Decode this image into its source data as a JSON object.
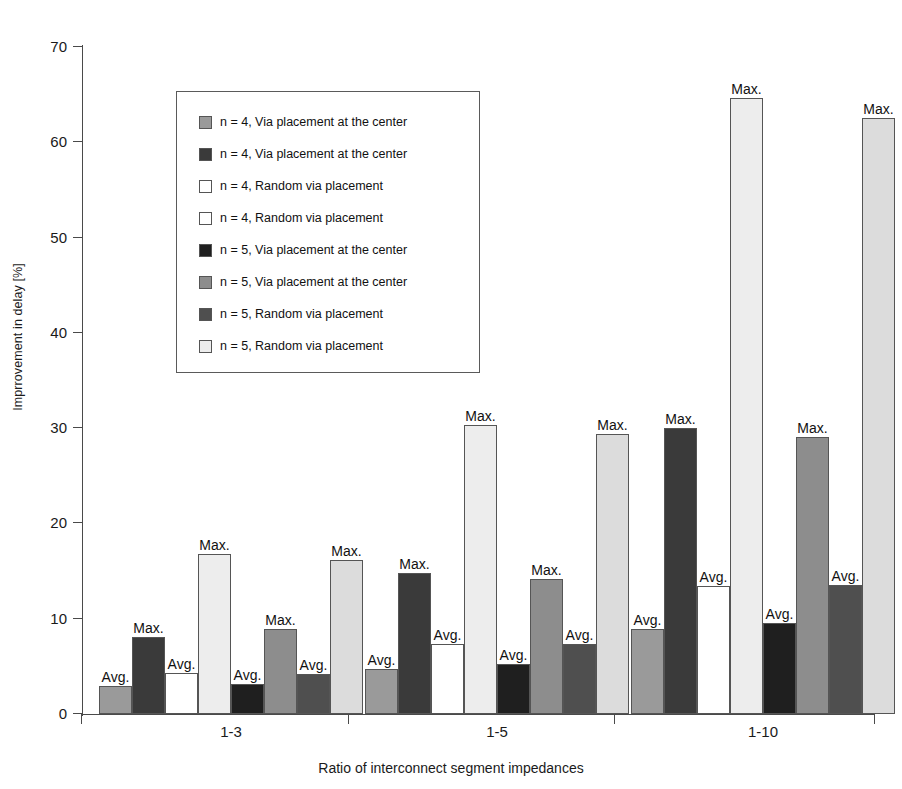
{
  "chart_data": {
    "type": "bar",
    "title": "",
    "subtitle": "",
    "xlabel": "Ratio of interconnect segment impedances",
    "ylabel": "Imprrovement in delay [%]",
    "ylim": [
      0,
      70
    ],
    "yticks": [
      0,
      10,
      20,
      30,
      40,
      50,
      60,
      70
    ],
    "ytick_labels": [
      "0",
      "10",
      "20",
      "30",
      "40",
      "50",
      "60",
      "70"
    ],
    "grid": false,
    "legend_position": "upper-left-inset",
    "categories": [
      "1-3",
      "1-5",
      "1-10"
    ],
    "series": [
      {
        "name": "n = 4, Via placement at the center",
        "stat": "Avg.",
        "color": "#9a9a9a",
        "values": [
          2.9,
          4.7,
          8.9
        ]
      },
      {
        "name": "n = 4, Via placement at the center",
        "stat": "Max.",
        "color": "#3a3a3a",
        "values": [
          8.1,
          14.8,
          30.0
        ]
      },
      {
        "name": "n = 4, Random via placement",
        "stat": "Avg.",
        "color": "#ffffff",
        "values": [
          4.3,
          7.3,
          13.4
        ]
      },
      {
        "name": "n = 4, Random via placement",
        "stat": "Max.",
        "color": "#ededed",
        "values": [
          16.8,
          30.3,
          64.6
        ]
      },
      {
        "name": "n = 5, Via placement at the center",
        "stat": "Avg.",
        "color": "#1f1f1f",
        "values": [
          3.1,
          5.2,
          9.5
        ]
      },
      {
        "name": "n = 5, Via placement at the center",
        "stat": "Max.",
        "color": "#8d8d8d",
        "values": [
          8.9,
          14.2,
          29.1
        ]
      },
      {
        "name": "n = 5, Random via placement",
        "stat": "Avg.",
        "color": "#4f4f4f",
        "values": [
          4.2,
          7.4,
          13.5
        ]
      },
      {
        "name": "n = 5, Random via placement",
        "stat": "Max.",
        "color": "#dcdcdc",
        "values": [
          16.2,
          29.4,
          62.6
        ]
      }
    ],
    "annotations": {
      "avg_label": "Avg.",
      "max_label": "Max."
    }
  },
  "legend": {
    "items": [
      {
        "label": "n = 4, Via placement at the center",
        "color": "#9a9a9a"
      },
      {
        "label": "n = 4, Via placement at the center",
        "color": "#3a3a3a"
      },
      {
        "label": "n = 4, Random via placement",
        "color": "#ffffff"
      },
      {
        "label": "n = 4, Random via placement",
        "color": "#ffffff"
      },
      {
        "label": "n = 5, Via placement at the center",
        "color": "#1f1f1f"
      },
      {
        "label": "n = 5, Via placement at the center",
        "color": "#8d8d8d"
      },
      {
        "label": "n = 5, Random via placement",
        "color": "#4f4f4f"
      },
      {
        "label": "n = 5, Random via placement",
        "color": "#ededed"
      }
    ]
  }
}
